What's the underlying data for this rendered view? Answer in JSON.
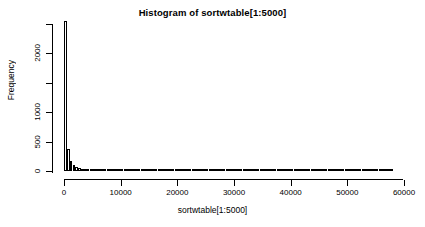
{
  "chart_data": {
    "type": "bar",
    "title": "Histogram of sortwtable[1:5000]",
    "xlabel": "sortwtable[1:5000]",
    "ylabel": "Frequency",
    "xlim": [
      0,
      58000
    ],
    "ylim": [
      0,
      2600
    ],
    "grid": false,
    "legend": null,
    "bin_width": 500,
    "x_ticks": [
      0,
      10000,
      20000,
      30000,
      40000,
      50000,
      60000
    ],
    "x_tick_labels": [
      "0",
      "10000",
      "20000",
      "30000",
      "40000",
      "50000",
      "60000"
    ],
    "y_ticks": [
      0,
      500,
      1000,
      1500,
      2000,
      2500
    ],
    "y_tick_labels": [
      "0",
      "500",
      "1000",
      "",
      "2000",
      ""
    ],
    "bin_starts": [
      0,
      500,
      1000,
      1500,
      2000,
      2500,
      3000,
      3500,
      4000,
      4500,
      5000,
      5500,
      6000,
      6500,
      7000,
      7500,
      8000,
      8500,
      9000,
      9500,
      10000,
      10500,
      11000,
      11500,
      12000,
      12500,
      13000,
      13500,
      14000,
      14500,
      15000,
      15500,
      16000,
      16500,
      17000,
      17500,
      18000,
      18500,
      19000,
      19500,
      20000,
      20500,
      21000,
      21500,
      22000,
      22500,
      23000,
      23500,
      24000,
      24500,
      25000,
      25500,
      26000,
      26500,
      27000,
      27500,
      28000,
      28500,
      29000,
      29500,
      30000,
      30500,
      31000,
      31500,
      32000,
      32500,
      33000,
      33500,
      34000,
      34500,
      35000,
      35500,
      36000,
      36500,
      37000,
      37500,
      38000,
      38500,
      39000,
      39500,
      40000,
      40500,
      41000,
      41500,
      42000,
      42500,
      43000,
      43500,
      44000,
      44500,
      45000,
      45500,
      46000,
      46500,
      47000,
      47500,
      48000,
      48500,
      49000,
      49500,
      50000,
      50500,
      51000,
      51500,
      52000,
      52500,
      53000,
      53500,
      54000,
      54500,
      55000,
      55500,
      56000,
      56500,
      57000,
      57500
    ],
    "values": [
      2550,
      380,
      170,
      95,
      60,
      45,
      35,
      28,
      24,
      20,
      17,
      15,
      13,
      12,
      11,
      10,
      9,
      8,
      8,
      7,
      7,
      6,
      6,
      5,
      5,
      5,
      4,
      4,
      4,
      4,
      3,
      3,
      3,
      3,
      3,
      3,
      2,
      2,
      2,
      2,
      2,
      2,
      2,
      2,
      2,
      2,
      2,
      1,
      1,
      1,
      1,
      1,
      1,
      1,
      1,
      1,
      1,
      1,
      1,
      1,
      1,
      1,
      1,
      1,
      1,
      1,
      1,
      1,
      1,
      1,
      1,
      1,
      1,
      1,
      1,
      1,
      1,
      1,
      1,
      1,
      1,
      1,
      1,
      1,
      1,
      1,
      1,
      1,
      1,
      1,
      1,
      1,
      1,
      1,
      1,
      1,
      1,
      1,
      1,
      1,
      1,
      1,
      1,
      1,
      1,
      1,
      1,
      1,
      1,
      1,
      1,
      1,
      1,
      1,
      1,
      1
    ]
  }
}
